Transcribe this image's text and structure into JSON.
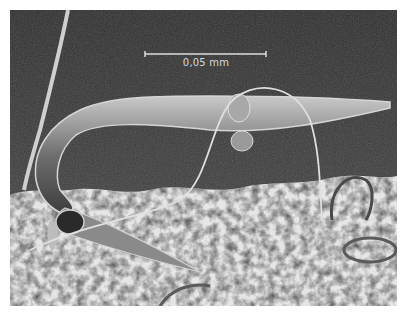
{
  "image": {
    "description": "Scanning electron micrograph of a nematode worm on a textured surface",
    "scale_bar": {
      "label": "0,05 mm"
    },
    "colors": {
      "background": "#3a3a3a",
      "substrate": "#e8e8e8",
      "worm": "#9a9a9a",
      "scale_bar": "#dcdcdc"
    }
  }
}
